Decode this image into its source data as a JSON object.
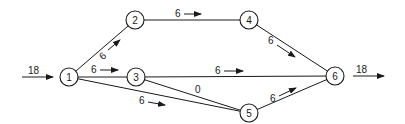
{
  "diagram": {
    "type": "flow-network",
    "nodes": [
      {
        "id": "1",
        "label": "1",
        "x": 69,
        "y": 77
      },
      {
        "id": "2",
        "label": "2",
        "x": 135,
        "y": 20
      },
      {
        "id": "3",
        "label": "3",
        "x": 136,
        "y": 77
      },
      {
        "id": "4",
        "label": "4",
        "x": 249,
        "y": 20
      },
      {
        "id": "5",
        "label": "5",
        "x": 249,
        "y": 113
      },
      {
        "id": "6",
        "label": "6",
        "x": 335,
        "y": 76
      }
    ],
    "edges": [
      {
        "from": "1",
        "to": "2",
        "flow": "6"
      },
      {
        "from": "1",
        "to": "3",
        "flow": "6"
      },
      {
        "from": "1",
        "to": "5",
        "flow": "6"
      },
      {
        "from": "2",
        "to": "4",
        "flow": "6"
      },
      {
        "from": "3",
        "to": "6",
        "flow": "6"
      },
      {
        "from": "3",
        "to": "5",
        "flow": "0"
      },
      {
        "from": "4",
        "to": "6",
        "flow": "6"
      },
      {
        "from": "5",
        "to": "6",
        "flow": "6"
      }
    ],
    "source_inflow": {
      "node": "1",
      "value": "18"
    },
    "sink_outflow": {
      "node": "6",
      "value": "18"
    }
  }
}
